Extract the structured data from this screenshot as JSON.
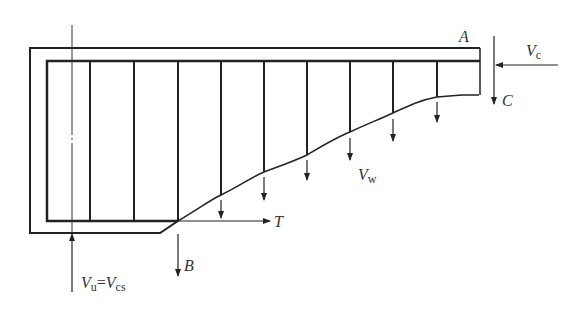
{
  "diagram": {
    "labels": {
      "A": "A",
      "B": "B",
      "C": "C",
      "T": "T",
      "Vc_main": "V",
      "Vc_sub": "c",
      "Vw_main": "V",
      "Vw_sub": "w",
      "Vu_main": "V",
      "Vu_sub": "u",
      "eq": "=",
      "Vcs_main": "V",
      "Vcs_sub": "cs"
    },
    "stirrup_x": [
      90,
      134,
      178,
      221,
      264,
      307,
      350,
      393,
      437
    ],
    "crack_points": [
      [
        178,
        221
      ],
      [
        221,
        195
      ],
      [
        264,
        172
      ],
      [
        307,
        155
      ],
      [
        350,
        132
      ],
      [
        393,
        113
      ],
      [
        437,
        97
      ],
      [
        479,
        95
      ]
    ],
    "colors": {
      "line": "#222222",
      "text": "#333333"
    }
  }
}
